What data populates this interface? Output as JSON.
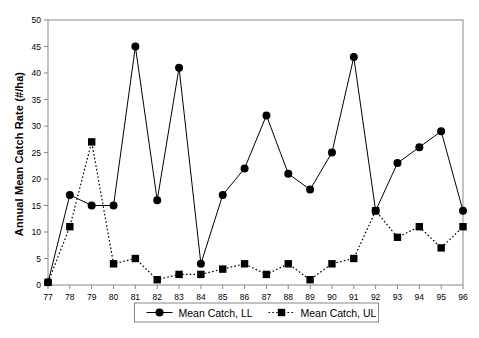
{
  "chart_data": {
    "type": "line",
    "title": "",
    "xlabel": "",
    "ylabel": "Annual Mean Catch Rate (#/ha)",
    "categories": [
      "77",
      "78",
      "79",
      "80",
      "81",
      "82",
      "83",
      "84",
      "85",
      "86",
      "87",
      "88",
      "89",
      "90",
      "91",
      "92",
      "93",
      "94",
      "95",
      "96"
    ],
    "xlim": [
      77,
      96
    ],
    "ylim": [
      0,
      50
    ],
    "yticks": [
      0,
      5,
      10,
      15,
      20,
      25,
      30,
      35,
      40,
      45,
      50
    ],
    "ytick_labels": [
      "0",
      "5",
      "10",
      "15",
      "20",
      "25",
      "30",
      "35",
      "40",
      "45",
      "50"
    ],
    "grid": false,
    "legend_position": "bottom-center",
    "series": [
      {
        "name": "Mean Catch, LL",
        "marker": "circle",
        "line_style": "solid",
        "color": "#000000",
        "values": [
          0.5,
          17,
          15,
          15,
          45,
          16,
          41,
          4,
          17,
          22,
          32,
          21,
          18,
          25,
          43,
          14,
          23,
          26,
          29,
          14
        ]
      },
      {
        "name": "Mean Catch, UL",
        "marker": "square",
        "line_style": "dotted",
        "color": "#000000",
        "values": [
          0.5,
          11,
          27,
          4,
          5,
          1,
          2,
          2,
          3,
          4,
          2,
          4,
          1,
          4,
          5,
          14,
          9,
          11,
          7,
          11
        ]
      }
    ]
  },
  "axes": {
    "y_title": "Annual Mean Catch Rate (#/ha)"
  },
  "legend": {
    "entries": [
      {
        "label": "Mean Catch, LL"
      },
      {
        "label": "Mean Catch, UL"
      }
    ]
  }
}
